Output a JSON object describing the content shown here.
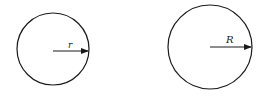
{
  "diagram": {
    "type": "two circles with radius arrows",
    "stroke_color": "#1a1a1a",
    "background": "#ffffff",
    "circles": [
      {
        "name": "small-circle",
        "cx": 53,
        "cy": 49,
        "r": 36,
        "radius_label": "r"
      },
      {
        "name": "large-circle",
        "cx": 210,
        "cy": 47,
        "r": 42,
        "radius_label": "R"
      }
    ]
  }
}
